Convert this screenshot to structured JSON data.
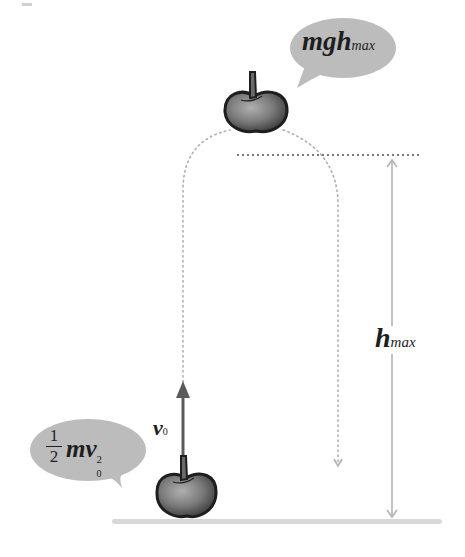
{
  "diagram": {
    "title": "",
    "colors": {
      "background": "#ffffff",
      "bubble_fill": "#bcbcbc",
      "apple_dark": "#2a2a2a",
      "apple_mid": "#6e6e6e",
      "apple_light": "#a8a8a8",
      "arrow_dark": "#5a5a5a",
      "guide_gray": "#b4b4b4",
      "dotted_line": "#7a7a7a",
      "ground": "#d6d6d6",
      "text": "#1e1e1e"
    },
    "top_bubble": {
      "label_main": "mgh",
      "label_sub": "max",
      "meaning": "potential energy at maximum height"
    },
    "bottom_bubble": {
      "fraction_numerator": "1",
      "fraction_denominator": "2",
      "label_main": "mv",
      "label_sub": "0",
      "label_sup": "2",
      "meaning": "initial kinetic energy"
    },
    "velocity_label": {
      "main": "v",
      "sub": "0"
    },
    "height_label": {
      "main": "h",
      "sub": "max"
    },
    "objects": [
      {
        "name": "apple-top",
        "position": "at maximum height"
      },
      {
        "name": "apple-bottom",
        "position": "on ground"
      }
    ]
  }
}
